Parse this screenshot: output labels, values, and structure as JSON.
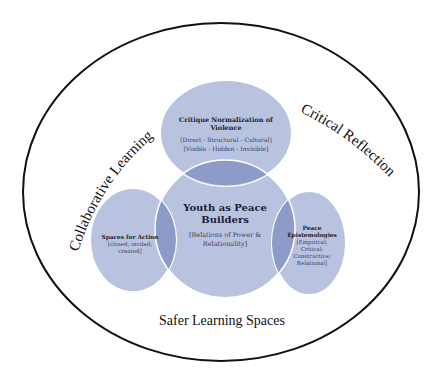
{
  "diagram": {
    "outer_frame": {
      "arc_labels": {
        "left": "Collaborative  Learning",
        "right": "Critical Reflection",
        "bottom": "Safer Learning Spaces"
      }
    },
    "center": {
      "title_line1": "Youth as Peace",
      "title_line2": "Builders",
      "subtitle_line1": "[Relations of Power &",
      "subtitle_line2": "Relationality]"
    },
    "top": {
      "title_line1": "Critique Normalization of",
      "title_line2": "Violence",
      "detail_line1": "[Direct - Structural - Cultural]",
      "detail_line2": "[Visible - Hidden - Invisible]"
    },
    "left": {
      "title": "Spaces for Action",
      "detail_line1": "[closed; invited;",
      "detail_line2": "created]"
    },
    "right": {
      "title_line1": "Peace",
      "title_line2": "Epistemologies",
      "detail_line1": "[Empirical;",
      "detail_line2": "Critical;",
      "detail_line3": "Constructive;",
      "detail_line4": "Relational]"
    },
    "colors": {
      "circle_fill": "#b9c3df",
      "overlap_fill": "#8d9bc8",
      "circle_stroke": "#ffffff",
      "outline": "#111111",
      "text": "#1a1f33"
    }
  }
}
